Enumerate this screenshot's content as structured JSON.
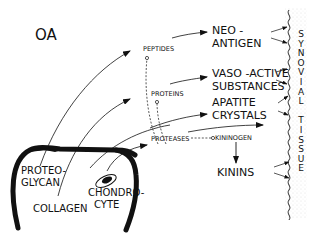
{
  "diagram": {
    "title": "OA",
    "labels": {
      "peptides": "PEPTIDES",
      "proteins": "PROTEINS",
      "proteases": "PROTEASES",
      "kininogen": "KININOGEN",
      "neo_antigen_1": "NEO -",
      "neo_antigen_2": "ANTIGEN",
      "vaso_1": "VASO -ACTIVE",
      "vaso_2": "SUBSTANCES",
      "apatite_1": "APATITE",
      "apatite_2": "CRYSTALS",
      "kinins": "KININS",
      "proteoglycan_1": "PROTEO-",
      "proteoglycan_2": "GLYCAN",
      "collagen": "COLLAGEN",
      "chondrocyte_1": "CHONDRO-",
      "chondrocyte_2": "CYTE"
    },
    "synovial_tissue": [
      "S",
      "Y",
      "N",
      "O",
      "V",
      "I",
      "A",
      "L",
      " ",
      "T",
      "I",
      "S",
      "S",
      "U",
      "E"
    ],
    "colors": {
      "ink": "#111111",
      "stipple": "#bbbbbb",
      "background": "#ffffff"
    }
  }
}
